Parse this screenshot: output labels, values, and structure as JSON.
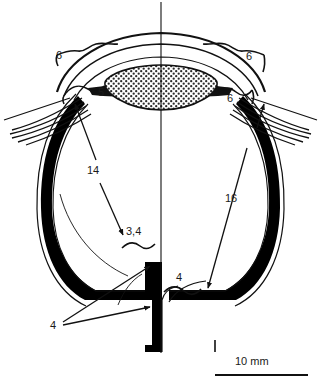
{
  "figure": {
    "kind": "anatomical-cross-section",
    "orientation": "vertical-midline-axis",
    "background_color": "#ffffff",
    "ink_color": "#000000",
    "label_color": "#1a1a1a"
  },
  "labels": [
    {
      "id": "six-upper-left",
      "text": "6",
      "x": 62,
      "y": 57,
      "connector": "wavy-brace"
    },
    {
      "id": "five-left",
      "text": "5",
      "x": 102,
      "y": 94,
      "connector": "wavy-brace"
    },
    {
      "id": "six-upper-right",
      "text": "6",
      "x": 249,
      "y": 58,
      "connector": "wavy-brace"
    },
    {
      "id": "six-lower-right",
      "text": "6",
      "x": 230,
      "y": 100,
      "connector": "wavy-brace-arrow"
    },
    {
      "id": "fourteen-left",
      "text": "14",
      "x": 91,
      "y": 172,
      "connector": "arrow"
    },
    {
      "id": "sixteen-right",
      "text": "16",
      "x": 228,
      "y": 200,
      "connector": "arrow"
    },
    {
      "id": "three-four",
      "text": "3,4",
      "x": 130,
      "y": 233,
      "connector": "wavy-brace-arrow"
    },
    {
      "id": "four-right",
      "text": "4",
      "x": 178,
      "y": 279,
      "connector": "wavy-brace-arrow"
    },
    {
      "id": "four-bottom-left",
      "text": "4",
      "x": 53,
      "y": 327,
      "connector": "double-arrow"
    }
  ],
  "scale_bar": {
    "text": "10 mm",
    "label_x": 235,
    "label_y": 361,
    "line_x1": 215,
    "line_x2": 308,
    "line_y": 375,
    "tick_x": 215,
    "tick_y_top": 340,
    "tick_y_bottom": 352
  },
  "structures": [
    {
      "id": "cornea",
      "description": "outer transparent anterior dome, thin double outline"
    },
    {
      "id": "lens",
      "description": "biconvex stippled body at anterior center"
    },
    {
      "id": "sclera-choroid",
      "description": "thick black outer wall shell of the globe"
    },
    {
      "id": "retina",
      "description": "inner thin line following the globe wall"
    },
    {
      "id": "ciliary-zonule-fibers-left",
      "description": "radiating fiber bundle left periphery"
    },
    {
      "id": "ciliary-zonule-fibers-right",
      "description": "radiating fiber bundle right periphery"
    },
    {
      "id": "optic-nerve",
      "description": "thick black stalk leaving posterior pole at midline"
    },
    {
      "id": "midline-axis",
      "description": "vertical optical axis line spanning full height"
    }
  ]
}
